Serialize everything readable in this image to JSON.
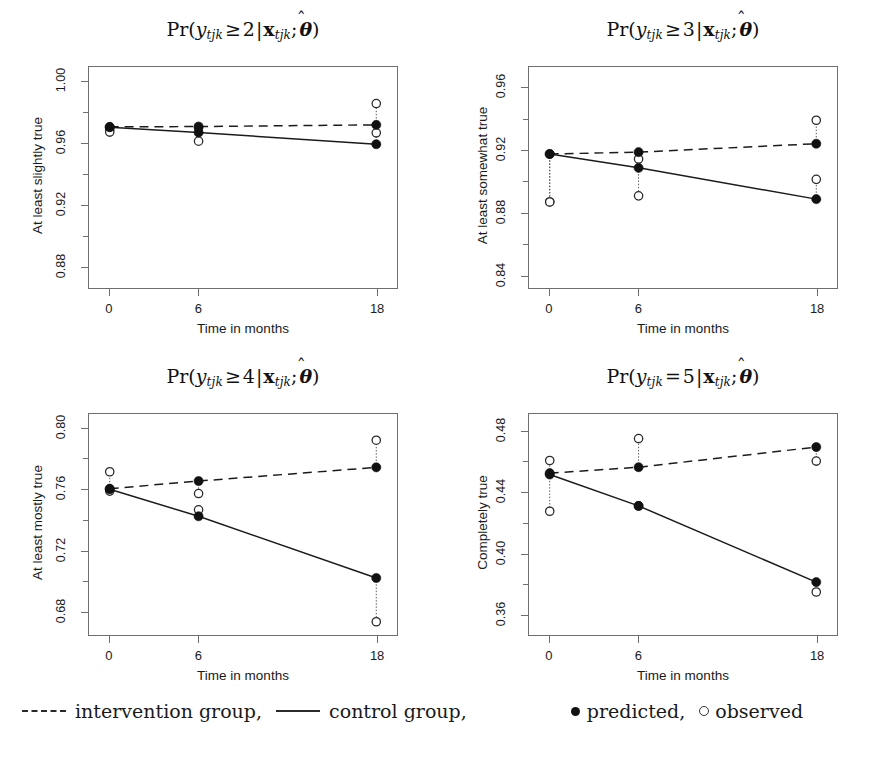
{
  "figure": {
    "xlabel": "Time in months",
    "legend": {
      "intervention_label": "intervention group,",
      "control_label": "control group,",
      "predicted_label": "predicted,",
      "observed_label": "observed",
      "dash_marker": "dashed-line-icon",
      "solid_marker": "solid-line-icon",
      "filled_marker": "filled-circle-icon",
      "open_marker": "open-circle-icon"
    }
  },
  "chart_data": [
    {
      "type": "line",
      "panel": "top-left",
      "title": "Pr(y_tjk >= 2 | x_tjk ; theta-hat)",
      "title_parts": {
        "fn": "Pr(",
        "var": "y",
        "var_sub": "tjk",
        "relation": "≥",
        "threshold": "2",
        "bar": "|",
        "cov": "x",
        "cov_sub": "tjk",
        "semicolon": ";",
        "param": "θ",
        "close": ")"
      },
      "ylabel": "At least slightly true",
      "xlabel": "Time in months",
      "x": [
        0,
        6,
        18
      ],
      "xticklabels": [
        "0",
        "6",
        "18"
      ],
      "xlim": [
        -1.4,
        19.4
      ],
      "ylim": [
        0.8655,
        1.0095
      ],
      "yticks": [
        0.88,
        0.92,
        0.96,
        1.0
      ],
      "yticklabels": [
        "0.88",
        "0.92",
        "0.96",
        "1.00"
      ],
      "grid": false,
      "series": [
        {
          "name": "intervention group",
          "kind": "predicted",
          "style": "dashed",
          "values": [
            0.9705,
            0.9707,
            0.9718
          ]
        },
        {
          "name": "intervention group",
          "kind": "observed",
          "style": "open",
          "values": [
            0.9688,
            0.9699,
            0.9857
          ]
        },
        {
          "name": "control group",
          "kind": "predicted",
          "style": "solid",
          "values": [
            0.9703,
            0.9668,
            0.9592
          ]
        },
        {
          "name": "control group",
          "kind": "observed",
          "style": "open",
          "values": [
            0.9671,
            0.9612,
            0.9666
          ]
        }
      ]
    },
    {
      "type": "line",
      "panel": "top-right",
      "title": "Pr(y_tjk >= 3 | x_tjk ; theta-hat)",
      "title_parts": {
        "fn": "Pr(",
        "var": "y",
        "var_sub": "tjk",
        "relation": "≥",
        "threshold": "3",
        "bar": "|",
        "cov": "x",
        "cov_sub": "tjk",
        "semicolon": ";",
        "param": "θ",
        "close": ")"
      },
      "ylabel": "At least somewhat true",
      "xlabel": "Time in months",
      "x": [
        0,
        6,
        18
      ],
      "xticklabels": [
        "0",
        "6",
        "18"
      ],
      "xlim": [
        -1.4,
        19.4
      ],
      "ylim": [
        0.8315,
        0.9735
      ],
      "yticks": [
        0.84,
        0.88,
        0.92,
        0.96
      ],
      "yticklabels": [
        "0.84",
        "0.88",
        "0.92",
        "0.96"
      ],
      "grid": false,
      "series": [
        {
          "name": "intervention group",
          "kind": "predicted",
          "style": "dashed",
          "values": [
            0.9176,
            0.9188,
            0.9242
          ]
        },
        {
          "name": "intervention group",
          "kind": "observed",
          "style": "open",
          "values": [
            0.8868,
            0.9144,
            0.9393
          ]
        },
        {
          "name": "control group",
          "kind": "predicted",
          "style": "solid",
          "values": [
            0.9176,
            0.9087,
            0.8886
          ]
        },
        {
          "name": "control group",
          "kind": "observed",
          "style": "open",
          "values": [
            0.8868,
            0.8907,
            0.9013
          ]
        }
      ]
    },
    {
      "type": "line",
      "panel": "bottom-left",
      "title": "Pr(y_tjk >= 4 | x_tjk ; theta-hat)",
      "title_parts": {
        "fn": "Pr(",
        "var": "y",
        "var_sub": "tjk",
        "relation": "≥",
        "threshold": "4",
        "bar": "|",
        "cov": "x",
        "cov_sub": "tjk",
        "semicolon": ";",
        "param": "θ",
        "close": ")"
      },
      "ylabel": "At least mostly true",
      "xlabel": "Time in months",
      "x": [
        0,
        6,
        18
      ],
      "xticklabels": [
        "0",
        "6",
        "18"
      ],
      "xlim": [
        -1.4,
        19.4
      ],
      "ylim": [
        0.6645,
        0.8095
      ],
      "yticks": [
        0.68,
        0.72,
        0.76,
        0.8
      ],
      "yticklabels": [
        "0.68",
        "0.72",
        "0.76",
        "0.80"
      ],
      "grid": false,
      "series": [
        {
          "name": "intervention group",
          "kind": "predicted",
          "style": "dashed",
          "values": [
            0.7605,
            0.7655,
            0.7745
          ]
        },
        {
          "name": "intervention group",
          "kind": "observed",
          "style": "open",
          "values": [
            0.7716,
            0.7573,
            0.7923
          ]
        },
        {
          "name": "control group",
          "kind": "predicted",
          "style": "solid",
          "values": [
            0.7601,
            0.7424,
            0.7019
          ]
        },
        {
          "name": "control group",
          "kind": "observed",
          "style": "open",
          "values": [
            0.7589,
            0.7466,
            0.6732
          ]
        }
      ]
    },
    {
      "type": "line",
      "panel": "bottom-right",
      "title": "Pr(y_tjk = 5 | x_tjk ; theta-hat)",
      "title_parts": {
        "fn": "Pr(",
        "var": "y",
        "var_sub": "tjk",
        "relation": "=",
        "threshold": "5",
        "bar": "|",
        "cov": "x",
        "cov_sub": "tjk",
        "semicolon": ";",
        "param": "θ",
        "close": ")"
      },
      "ylabel": "Completely true",
      "xlabel": "Time in months",
      "x": [
        0,
        6,
        18
      ],
      "xticklabels": [
        "0",
        "6",
        "18"
      ],
      "xlim": [
        -1.4,
        19.4
      ],
      "ylim": [
        0.3465,
        0.4915
      ],
      "yticks": [
        0.36,
        0.4,
        0.44,
        0.48
      ],
      "yticklabels": [
        "0.36",
        "0.40",
        "0.44",
        "0.48"
      ],
      "grid": false,
      "series": [
        {
          "name": "intervention group",
          "kind": "predicted",
          "style": "dashed",
          "values": [
            0.4527,
            0.4566,
            0.4698
          ]
        },
        {
          "name": "intervention group",
          "kind": "observed",
          "style": "open",
          "values": [
            0.461,
            0.4754,
            0.4606
          ]
        },
        {
          "name": "control group",
          "kind": "predicted",
          "style": "solid",
          "values": [
            0.4518,
            0.4312,
            0.3812
          ]
        },
        {
          "name": "control group",
          "kind": "observed",
          "style": "open",
          "values": [
            0.4277,
            0.4312,
            0.3747
          ]
        }
      ]
    }
  ]
}
